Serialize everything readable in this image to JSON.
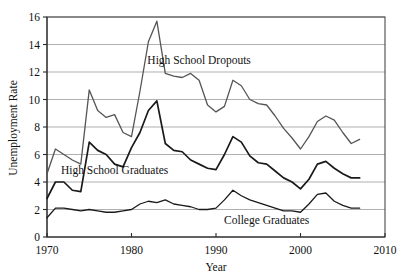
{
  "chart_data": {
    "type": "line",
    "title": "",
    "xlabel": "Year",
    "ylabel": "Unemployment Rate",
    "xlim": [
      1970,
      2010
    ],
    "ylim": [
      0,
      16
    ],
    "xticks": [
      1970,
      1980,
      1990,
      2000,
      2010
    ],
    "yticks": [
      0,
      2,
      4,
      6,
      8,
      10,
      12,
      14,
      16
    ],
    "grid": "horizontal",
    "legend_position": "inline-annotations",
    "x": [
      1970,
      1971,
      1972,
      1973,
      1974,
      1975,
      1976,
      1977,
      1978,
      1979,
      1980,
      1981,
      1982,
      1983,
      1984,
      1985,
      1986,
      1987,
      1988,
      1989,
      1990,
      1991,
      1992,
      1993,
      1994,
      1995,
      1996,
      1997,
      1998,
      1999,
      2000,
      2001,
      2002,
      2003,
      2004,
      2005,
      2006,
      2007
    ],
    "series": [
      {
        "name": "High School Dropouts",
        "color": "#555555",
        "width": 1.3,
        "label_x": 1988,
        "label_y": 12.6,
        "values": [
          4.6,
          6.4,
          6.0,
          5.6,
          5.3,
          10.7,
          9.2,
          8.7,
          8.9,
          7.6,
          7.3,
          10.6,
          14.2,
          15.7,
          11.9,
          11.7,
          11.6,
          11.9,
          11.4,
          9.6,
          9.1,
          9.5,
          11.4,
          11.0,
          10.0,
          9.7,
          9.6,
          8.8,
          7.9,
          7.2,
          6.4,
          7.3,
          8.4,
          8.8,
          8.5,
          7.6,
          6.8,
          7.1
        ]
      },
      {
        "name": "High School Graduates",
        "color": "#1a1a1a",
        "width": 1.7,
        "label_x": 1978,
        "label_y": 4.55,
        "values": [
          2.8,
          4.0,
          4.0,
          3.4,
          3.3,
          6.9,
          6.3,
          6.0,
          5.3,
          5.1,
          6.5,
          7.6,
          9.2,
          9.9,
          6.8,
          6.3,
          6.2,
          5.6,
          5.3,
          5.0,
          4.9,
          6.0,
          7.3,
          6.9,
          5.9,
          5.4,
          5.3,
          4.8,
          4.3,
          4.0,
          3.5,
          4.2,
          5.3,
          5.5,
          5.0,
          4.6,
          4.3,
          4.3
        ]
      },
      {
        "name": "College Graduates",
        "color": "#1a1a1a",
        "width": 1.3,
        "label_x": 1996,
        "label_y": 0.95,
        "values": [
          1.4,
          2.1,
          2.1,
          2.0,
          1.9,
          2.0,
          1.9,
          1.8,
          1.8,
          1.9,
          2.0,
          2.4,
          2.6,
          2.5,
          2.7,
          2.4,
          2.3,
          2.2,
          2.0,
          2.0,
          2.1,
          2.7,
          3.4,
          3.0,
          2.7,
          2.5,
          2.3,
          2.1,
          1.9,
          1.9,
          1.8,
          2.4,
          3.1,
          3.2,
          2.6,
          2.3,
          2.1,
          2.1
        ]
      }
    ]
  },
  "axis": {
    "y_title": "Unemployment Rate",
    "x_title": "Year",
    "y_tick_labels": [
      "0",
      "2",
      "4",
      "6",
      "8",
      "10",
      "12",
      "14",
      "16"
    ],
    "x_tick_labels": [
      "1970",
      "1980",
      "1990",
      "2000",
      "2010"
    ]
  },
  "annotations": {
    "dropouts": "High School Dropouts",
    "graduates": "High School Graduates",
    "college": "College Graduates"
  },
  "colors": {
    "background": "#ffffff",
    "grid": "#8e8e8e",
    "frame": "#4a4a4a",
    "dropouts_line": "#555555",
    "graduates_line": "#1a1a1a",
    "college_line": "#1a1a1a"
  }
}
